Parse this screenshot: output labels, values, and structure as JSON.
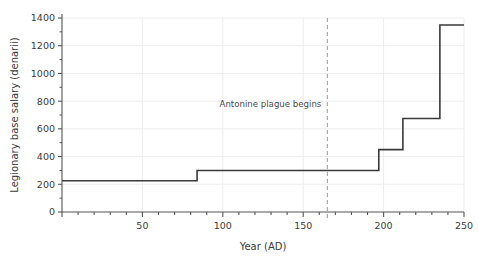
{
  "chart_data": {
    "type": "line",
    "subtype": "step-post",
    "title": "",
    "subtitle": "",
    "xlabel": "Year (AD)",
    "ylabel": "Legionary base salary (denarii)",
    "xlim": [
      0,
      250
    ],
    "ylim": [
      0,
      1400
    ],
    "xticks": [
      0,
      50,
      100,
      150,
      200,
      250
    ],
    "xtick_labels": [
      "",
      "50",
      "100",
      "150",
      "200",
      "250"
    ],
    "xminor_step": 10,
    "yticks": [
      0,
      200,
      400,
      600,
      800,
      1000,
      1200,
      1400
    ],
    "ytick_labels": [
      "0",
      "200",
      "400",
      "600",
      "800",
      "1000",
      "1200",
      "1400"
    ],
    "yminor_step": 100,
    "grid": true,
    "grid_axis": "both",
    "legend": false,
    "legend_position": "none",
    "series": [
      {
        "name": "Legionary base salary",
        "color": "#3a3a3a",
        "x": [
          0,
          84,
          84,
          197,
          197,
          212,
          212,
          235,
          235,
          250
        ],
        "values": [
          225,
          225,
          300,
          300,
          450,
          450,
          675,
          675,
          1350,
          1350
        ],
        "steps": [
          {
            "start_year": 0,
            "end_year": 84,
            "salary": 225
          },
          {
            "start_year": 84,
            "end_year": 197,
            "salary": 300
          },
          {
            "start_year": 197,
            "end_year": 212,
            "salary": 450
          },
          {
            "start_year": 212,
            "end_year": 235,
            "salary": 675
          },
          {
            "start_year": 235,
            "end_year": 250,
            "salary": 1350
          }
        ]
      }
    ],
    "annotations": [
      {
        "type": "vline",
        "x": 165,
        "label": "Antonine plague begins",
        "label_x": 165,
        "label_y": 760,
        "label_anchor": "end",
        "style": "dashed",
        "color": "#9a9a9a"
      }
    ],
    "colors": {
      "line": "#3a3a3a",
      "grid": "#ededed",
      "axis": "#555555",
      "text": "#3a3a3a",
      "annotation": "#9a9a9a",
      "background": "#ffffff"
    }
  }
}
